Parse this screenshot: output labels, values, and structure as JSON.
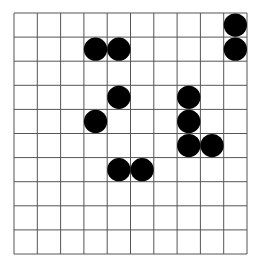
{
  "board": {
    "rows": 10,
    "cols": 10,
    "grid_color": "#555555",
    "stone_color": "#000000",
    "background": "#ffffff",
    "stones": [
      {
        "row": 0,
        "col": 9
      },
      {
        "row": 1,
        "col": 3
      },
      {
        "row": 1,
        "col": 4
      },
      {
        "row": 1,
        "col": 9
      },
      {
        "row": 3,
        "col": 4
      },
      {
        "row": 3,
        "col": 7
      },
      {
        "row": 4,
        "col": 3
      },
      {
        "row": 4,
        "col": 7
      },
      {
        "row": 5,
        "col": 7
      },
      {
        "row": 5,
        "col": 8
      },
      {
        "row": 6,
        "col": 4
      },
      {
        "row": 6,
        "col": 5
      }
    ]
  }
}
